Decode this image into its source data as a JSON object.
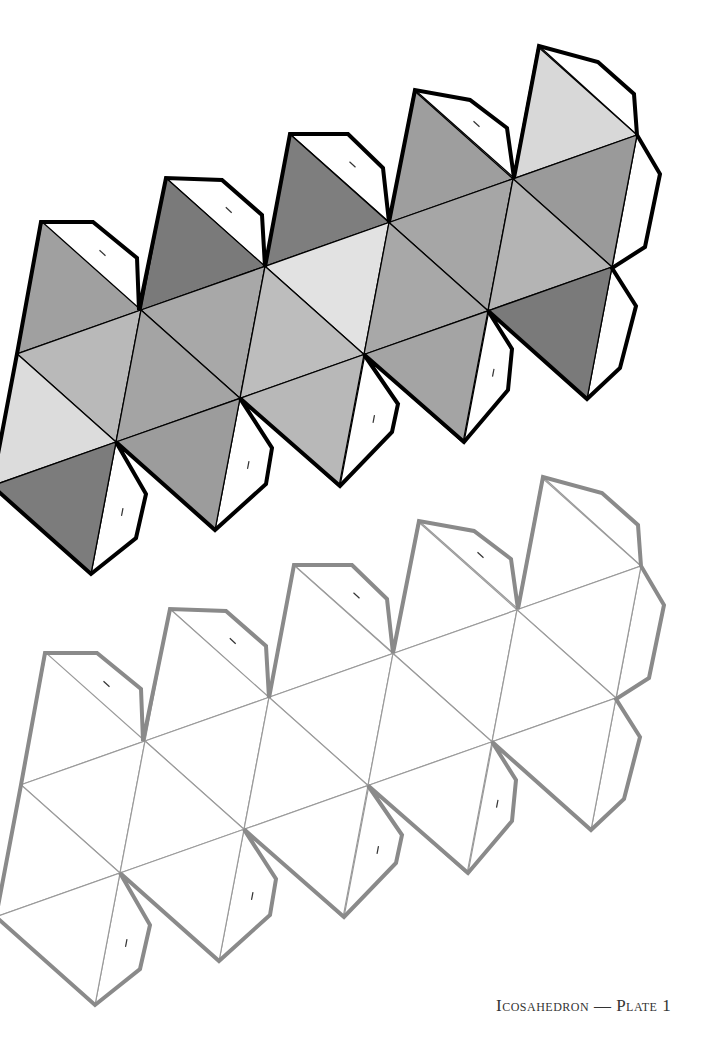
{
  "caption": "Icosahedron — Plate 1",
  "lattice": {
    "origin": [
      141,
      310
    ],
    "a": [
      124,
      -43.75
    ],
    "up": [
      25,
      -132
    ],
    "down": [
      -25,
      132
    ]
  },
  "nets": [
    {
      "name": "shaded-net",
      "offset": [
        0,
        0
      ],
      "outline_color": "#000000",
      "outline_width": 4,
      "line_color": "#000000",
      "line_width": 1.3,
      "tab_fill": "#ffffff",
      "faces": {
        "apex": [
          "#a0a0a0",
          "#7a7a7a",
          "#7e7e7e",
          "#9e9e9e",
          "#d8d8d8"
        ],
        "band_down": [
          "#b9b9b9",
          "#a8a8a8",
          "#e2e2e2",
          "#a6a6a6",
          "#9a9a9a"
        ],
        "band_up": [
          "#dcdcdc",
          "#a4a4a4",
          "#bdbdbd",
          "#a8a8a8",
          "#b4b4b4"
        ],
        "bottom": [
          "#7c7c7c",
          "#9c9c9c",
          "#b8b8b8",
          "#a4a4a4",
          "#7a7a7a"
        ]
      }
    },
    {
      "name": "blank-net",
      "offset": [
        4,
        431
      ],
      "outline_color": "#8a8a8a",
      "outline_width": 4,
      "line_color": "#9a9a9a",
      "line_width": 1.2,
      "tab_fill": "#ffffff",
      "faces": {
        "apex": [
          "#ffffff",
          "#ffffff",
          "#ffffff",
          "#ffffff",
          "#ffffff"
        ],
        "band_down": [
          "#ffffff",
          "#ffffff",
          "#ffffff",
          "#ffffff",
          "#ffffff"
        ],
        "band_up": [
          "#ffffff",
          "#ffffff",
          "#ffffff",
          "#ffffff",
          "#ffffff"
        ],
        "bottom": [
          "#ffffff",
          "#ffffff",
          "#ffffff",
          "#ffffff",
          "#ffffff"
        ]
      }
    }
  ],
  "tabs": {
    "apex_tabs": [
      [
        [
          41,
          222
        ],
        [
          93,
          222
        ],
        [
          137,
          258
        ],
        [
          139,
          310
        ]
      ],
      [
        [
          166,
          178
        ],
        [
          222,
          180
        ],
        [
          262,
          215
        ],
        [
          265,
          267
        ]
      ],
      [
        [
          290,
          134
        ],
        [
          348,
          134
        ],
        [
          383,
          168
        ],
        [
          389,
          222
        ]
      ],
      [
        [
          415,
          90
        ],
        [
          470,
          100
        ],
        [
          507,
          128
        ],
        [
          514,
          178
        ]
      ],
      [
        [
          539,
          46
        ],
        [
          598,
          62
        ],
        [
          634,
          94
        ],
        [
          637,
          135
        ]
      ]
    ],
    "right_tab": [
      [
        637,
        135
      ],
      [
        660,
        174
      ],
      [
        645,
        247
      ],
      [
        612,
        268
      ]
    ],
    "bottom_tabs": [
      [
        [
          116,
          442
        ],
        [
          146,
          494
        ],
        [
          136,
          538
        ],
        [
          91,
          574
        ]
      ],
      [
        [
          240,
          398
        ],
        [
          272,
          448
        ],
        [
          266,
          484
        ],
        [
          215,
          530
        ]
      ],
      [
        [
          365,
          354
        ],
        [
          398,
          404
        ],
        [
          392,
          432
        ],
        [
          340,
          486
        ]
      ],
      [
        [
          489,
          310
        ],
        [
          512,
          349
        ],
        [
          508,
          390
        ],
        [
          464,
          442
        ]
      ],
      [
        [
          612,
          267
        ],
        [
          636,
          306
        ],
        [
          620,
          368
        ],
        [
          587,
          399
        ]
      ]
    ],
    "mark_color": "#333333"
  }
}
